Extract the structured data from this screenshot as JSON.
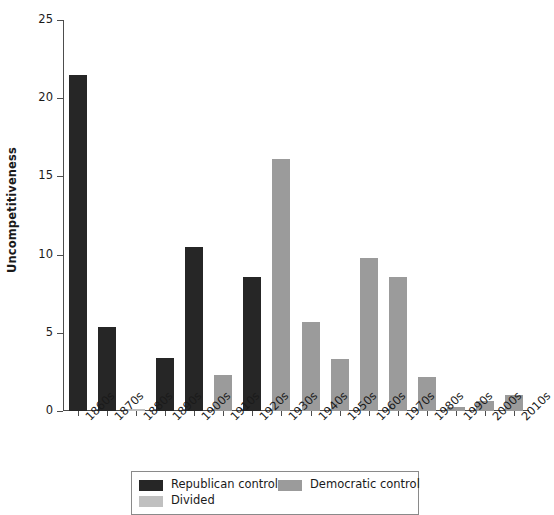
{
  "chart_data": {
    "type": "bar",
    "title": "",
    "xlabel": "",
    "ylabel": "Uncompetitiveness",
    "ylim": [
      0,
      25
    ],
    "yticks": [
      0,
      5,
      10,
      15,
      20,
      25
    ],
    "ytick_labels": [
      "0",
      "5",
      "10",
      "15",
      "20",
      "25"
    ],
    "grid": false,
    "legend_position": "bottom",
    "categories": [
      "1860s",
      "1870s",
      "1880s",
      "1890s",
      "1900s",
      "1910s",
      "1920s",
      "1930s",
      "1940s",
      "1950s",
      "1960s",
      "1970s",
      "1980s",
      "1990s",
      "2000s",
      "2010s"
    ],
    "values": [
      21.5,
      5.4,
      0.1,
      3.4,
      10.5,
      2.3,
      8.6,
      16.1,
      5.7,
      3.3,
      9.8,
      8.6,
      2.2,
      0.25,
      0.65,
      1.0
    ],
    "point_categories": [
      "Republican control",
      "Republican control",
      "Divided",
      "Republican control",
      "Republican control",
      "Democratic control",
      "Republican control",
      "Democratic control",
      "Democratic control",
      "Democratic control",
      "Democratic control",
      "Democratic control",
      "Democratic control",
      "Democratic control",
      "Democratic control",
      "Democratic control"
    ],
    "series": [
      {
        "name": "Republican control",
        "color": "#262626",
        "values": [
          21.5,
          5.4,
          null,
          3.4,
          10.5,
          null,
          8.6,
          null,
          null,
          null,
          null,
          null,
          null,
          null,
          null,
          null
        ]
      },
      {
        "name": "Democratic control",
        "color": "#9b9b9b",
        "values": [
          null,
          null,
          null,
          null,
          null,
          2.3,
          null,
          16.1,
          5.7,
          3.3,
          9.8,
          8.6,
          2.2,
          0.25,
          0.65,
          1.0
        ]
      },
      {
        "name": "Divided",
        "color": "#c0c0c0",
        "values": [
          null,
          null,
          0.1,
          null,
          null,
          null,
          null,
          null,
          null,
          null,
          null,
          null,
          null,
          null,
          null,
          null
        ]
      }
    ]
  },
  "legend": {
    "entries": [
      {
        "label": "Republican control",
        "color": "#262626"
      },
      {
        "label": "Democratic control",
        "color": "#9b9b9b"
      },
      {
        "label": "Divided",
        "color": "#c0c0c0"
      }
    ]
  },
  "axes": {
    "y_title": "Uncompetitiveness"
  }
}
